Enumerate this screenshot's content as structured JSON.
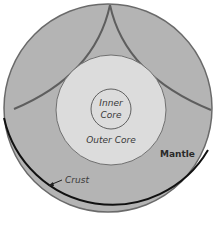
{
  "diagram": {
    "colors": {
      "background": "#ffffff",
      "mantle_fill": "#b4b4b4",
      "outer_core_fill": "#dcdcdc",
      "inner_core_fill": "#dcdcdc",
      "outline": "#6a6a6a",
      "crust_arc": "#111111"
    },
    "layers": [
      {
        "id": "inner_core",
        "label_line1": "Inner",
        "label_line2": "Core"
      },
      {
        "id": "outer_core",
        "label": "Outer Core"
      },
      {
        "id": "mantle",
        "label": "Mantle"
      },
      {
        "id": "crust",
        "label": "Crust"
      }
    ]
  }
}
